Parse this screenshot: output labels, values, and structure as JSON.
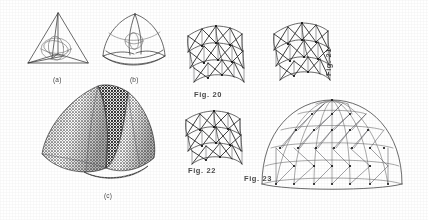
{
  "page": {
    "background": "#ffffff",
    "ink": "#3a3a3a",
    "width": 428,
    "height": 220
  },
  "left_group": {
    "figures": [
      {
        "id": "tetrahedron-wireframe",
        "caption": "(a)",
        "description": "Wireframe tetrahedron with inscribed sphere shown as great circles"
      },
      {
        "id": "rounded-tetrahedron",
        "caption": "(b)",
        "description": "Tetrahedron with bulged spherical faces and inscribed circles"
      },
      {
        "id": "mesh-tetrahedron-halftone",
        "caption": "(c)",
        "description": "Halftone rendering of a triangulated mesh tetrahedral dome form"
      }
    ]
  },
  "right_group": {
    "figures": [
      {
        "id": "truss-panel-20",
        "caption": "Fig. 20",
        "description": "Isometric triangulated space-frame panel, shallow curvature"
      },
      {
        "id": "truss-panel-21",
        "caption": "Fig. 21",
        "description": "Isometric triangulated space-frame panel, steeper curvature",
        "caption_rotated": true
      },
      {
        "id": "truss-panel-22",
        "caption": "Fig. 22",
        "description": "Isometric triangulated space-frame panel, assembly variant"
      },
      {
        "id": "geodesic-dome-23",
        "caption": "Fig. 23",
        "description": "Assembled hemispherical geodesic dome with triangulated lattice"
      }
    ]
  },
  "colors": {
    "ink_dark": "#2b2b2b",
    "ink_mid": "#3a3a3a",
    "ink_light": "#6f6f6f",
    "caption": "#3c3c3c",
    "paper": "#ffffff"
  }
}
